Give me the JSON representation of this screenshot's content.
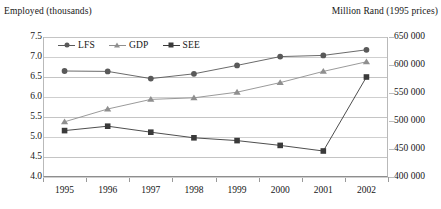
{
  "left_axis_title": "Employed (thousands)",
  "right_axis_title": "Million Rand (1995 prices)",
  "legend": [
    {
      "label": "LFS",
      "marker": "circle-marker-icon",
      "color": "#595959"
    },
    {
      "label": "GDP",
      "marker": "triangle-marker-icon",
      "color": "#8f8f8f"
    },
    {
      "label": "SEE",
      "marker": "square-marker-icon",
      "color": "#3a3a3a"
    }
  ],
  "chart_data": {
    "type": "line",
    "title": "",
    "xlabel": "",
    "ylabel": "Employed (thousands)",
    "y2label": "Million Rand (1995 prices)",
    "grid": true,
    "legend_position": "top-left-inside",
    "categories": [
      "1995",
      "1996",
      "1997",
      "1998",
      "1999",
      "2000",
      "2001",
      "2002"
    ],
    "ylim": [
      4.0,
      7.5
    ],
    "yticks": [
      "7.5",
      "7.0",
      "6.5",
      "6.0",
      "5.5",
      "5.0",
      "4.5",
      "4.0"
    ],
    "ytick_values": [
      7.5,
      7.0,
      6.5,
      6.0,
      5.5,
      5.0,
      4.5,
      4.0
    ],
    "y2lim": [
      400000,
      650000
    ],
    "y2ticks": [
      "650 000",
      "600 000",
      "550 000",
      "500 000",
      "450 000",
      "400 000"
    ],
    "y2tick_values": [
      650000,
      600000,
      550000,
      500000,
      450000,
      400000
    ],
    "series": [
      {
        "name": "LFS",
        "axis": "left",
        "marker": "circle",
        "color": "#595959",
        "values": [
          6.65,
          6.64,
          6.46,
          6.58,
          6.79,
          7.01,
          7.04,
          7.18
        ]
      },
      {
        "name": "GDP",
        "axis": "left",
        "marker": "triangle",
        "color": "#8f8f8f",
        "values": [
          5.38,
          5.7,
          5.94,
          5.98,
          6.12,
          6.36,
          6.64,
          6.88
        ]
      },
      {
        "name": "SEE",
        "axis": "left",
        "marker": "square",
        "color": "#3a3a3a",
        "values": [
          5.16,
          5.27,
          5.12,
          4.98,
          4.91,
          4.79,
          4.65,
          6.5
        ]
      }
    ]
  }
}
